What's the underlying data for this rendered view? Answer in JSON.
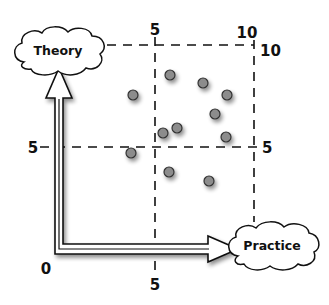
{
  "diagram": {
    "colors": {
      "background": "#ffffff",
      "stroke": "#111111",
      "dot_fill": "#8c8c8c",
      "dot_outline": "#333333",
      "shadow": "#000000"
    },
    "clouds": {
      "theory": {
        "label": "Theory"
      },
      "practice": {
        "label": "Practice"
      }
    },
    "axis_labels": {
      "origin": "0",
      "x_mid_bottom": "5",
      "x_mid_top": "5",
      "x_max_top": "10",
      "y_max_right": "10",
      "y_mid_left": "5",
      "y_mid_right": "5"
    },
    "points": [
      {
        "x": 3.0,
        "y": 8.3
      },
      {
        "x": 5.3,
        "y": 9.3
      },
      {
        "x": 7.4,
        "y": 8.9
      },
      {
        "x": 8.8,
        "y": 8.3
      },
      {
        "x": 8.1,
        "y": 7.4
      },
      {
        "x": 5.7,
        "y": 6.7
      },
      {
        "x": 4.9,
        "y": 6.4
      },
      {
        "x": 8.8,
        "y": 6.2
      },
      {
        "x": 2.9,
        "y": 5.3
      },
      {
        "x": 5.2,
        "y": 4.3
      },
      {
        "x": 7.7,
        "y": 3.9
      }
    ]
  }
}
